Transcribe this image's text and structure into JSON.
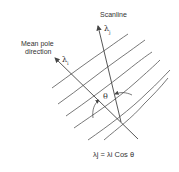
{
  "diagram": {
    "labels": {
      "scanline": "Scanline",
      "mean_pole_line1": "Mean pole",
      "mean_pole_line2": "direction",
      "lambda_j": "λ",
      "lambda_j_sub": "j",
      "lambda_i": "λ",
      "lambda_i_sub": "i",
      "theta": "θ",
      "formula": "λj = λi Cos θ"
    },
    "colors": {
      "line": "#444444",
      "text": "#333333",
      "background": "#ffffff"
    }
  }
}
